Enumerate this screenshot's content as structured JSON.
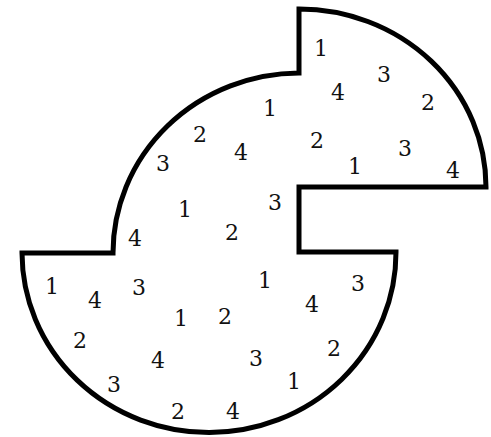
{
  "diagram": {
    "type": "number-region-puzzle",
    "outline_color": "#000000",
    "background": "#ffffff",
    "numbers": [
      {
        "value": "1",
        "x": 321,
        "y": 50
      },
      {
        "value": "3",
        "x": 384,
        "y": 76
      },
      {
        "value": "4",
        "x": 338,
        "y": 94
      },
      {
        "value": "2",
        "x": 428,
        "y": 104
      },
      {
        "value": "1",
        "x": 270,
        "y": 110
      },
      {
        "value": "2",
        "x": 200,
        "y": 136
      },
      {
        "value": "2",
        "x": 317,
        "y": 142
      },
      {
        "value": "4",
        "x": 241,
        "y": 154
      },
      {
        "value": "3",
        "x": 405,
        "y": 150
      },
      {
        "value": "3",
        "x": 163,
        "y": 165
      },
      {
        "value": "1",
        "x": 355,
        "y": 168
      },
      {
        "value": "4",
        "x": 453,
        "y": 172
      },
      {
        "value": "3",
        "x": 275,
        "y": 204
      },
      {
        "value": "1",
        "x": 185,
        "y": 211
      },
      {
        "value": "2",
        "x": 232,
        "y": 234
      },
      {
        "value": "4",
        "x": 135,
        "y": 240
      },
      {
        "value": "1",
        "x": 265,
        "y": 282
      },
      {
        "value": "3",
        "x": 358,
        "y": 285
      },
      {
        "value": "1",
        "x": 52,
        "y": 288
      },
      {
        "value": "3",
        "x": 139,
        "y": 289
      },
      {
        "value": "4",
        "x": 95,
        "y": 302
      },
      {
        "value": "4",
        "x": 312,
        "y": 306
      },
      {
        "value": "1",
        "x": 181,
        "y": 320
      },
      {
        "value": "2",
        "x": 225,
        "y": 318
      },
      {
        "value": "2",
        "x": 80,
        "y": 342
      },
      {
        "value": "2",
        "x": 334,
        "y": 350
      },
      {
        "value": "4",
        "x": 158,
        "y": 362
      },
      {
        "value": "3",
        "x": 256,
        "y": 360
      },
      {
        "value": "3",
        "x": 114,
        "y": 386
      },
      {
        "value": "1",
        "x": 294,
        "y": 383
      },
      {
        "value": "2",
        "x": 178,
        "y": 413
      },
      {
        "value": "4",
        "x": 233,
        "y": 413
      }
    ]
  }
}
